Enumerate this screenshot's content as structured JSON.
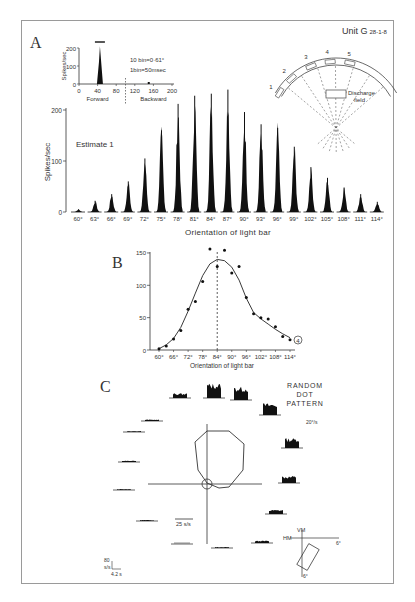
{
  "figure": {
    "unit_label": "Unit G",
    "unit_sub": "28-1-8",
    "panel_labels": [
      "A",
      "B",
      "C"
    ]
  },
  "chart_data": [
    {
      "id": "A-inset",
      "type": "bar",
      "title": "",
      "ylabel": "Spikes/sec",
      "ylim": [
        0,
        200
      ],
      "yticks": [
        0,
        100,
        200
      ],
      "xticks": [
        0,
        40,
        80,
        120,
        160,
        200
      ],
      "xlabels": {
        "left": "Forward",
        "right": "Backward"
      },
      "divider_x": 100,
      "annotations": [
        "10 bin=0·61°",
        "1bin=50msec"
      ],
      "peaks": [
        {
          "x": 45,
          "y": 210
        },
        {
          "x": 150,
          "y": 5
        }
      ]
    },
    {
      "id": "A-main",
      "type": "bar",
      "title": "",
      "annotation": "Estimate 1",
      "xlabel": "Orientation of light bar",
      "ylabel": "Spikes/sec",
      "ylim": [
        0,
        250
      ],
      "yticks": [
        0,
        100,
        200
      ],
      "categories": [
        "60°",
        "63°",
        "66°",
        "69°",
        "72°",
        "75°",
        "78°",
        "81°",
        "84°",
        "87°",
        "90°",
        "93°",
        "96°",
        "99°",
        "102°",
        "105°",
        "108°",
        "111°",
        "114°"
      ],
      "values": [
        5,
        22,
        35,
        60,
        105,
        160,
        212,
        228,
        232,
        240,
        196,
        172,
        165,
        128,
        88,
        67,
        48,
        35,
        20
      ]
    },
    {
      "id": "B",
      "type": "scatter",
      "title": "",
      "xlabel": "Orientation of light bar",
      "ylabel": "",
      "ylim": [
        0,
        150
      ],
      "yticks": [
        0,
        50,
        100,
        150
      ],
      "xticks": [
        "60°",
        "66°",
        "72°",
        "78°",
        "84°",
        "90°",
        "96°",
        "102°",
        "108°",
        "114°"
      ],
      "x": [
        60,
        63,
        66,
        69,
        72,
        75,
        78,
        81,
        84,
        87,
        90,
        93,
        96,
        99,
        102,
        105,
        108,
        111,
        114
      ],
      "values": [
        2,
        6,
        17,
        30,
        63,
        75,
        106,
        156,
        129,
        154,
        119,
        129,
        81,
        56,
        50,
        48,
        36,
        21,
        16
      ],
      "fit_curve": [
        [
          60,
          2
        ],
        [
          63,
          8
        ],
        [
          66,
          18
        ],
        [
          69,
          35
        ],
        [
          72,
          60
        ],
        [
          75,
          88
        ],
        [
          78,
          115
        ],
        [
          81,
          133
        ],
        [
          84,
          140
        ],
        [
          87,
          138
        ],
        [
          90,
          128
        ],
        [
          93,
          108
        ],
        [
          96,
          80
        ],
        [
          99,
          58
        ],
        [
          102,
          48
        ],
        [
          105,
          40
        ],
        [
          108,
          32
        ],
        [
          111,
          25
        ],
        [
          114,
          19
        ]
      ],
      "peak_marker_x": 84,
      "end_marker": "4"
    },
    {
      "id": "C",
      "type": "polar",
      "title": "RANDOM DOT PATTERN",
      "speed": "20°/s",
      "polar_scale": "25 s/s",
      "hist_scale_y": "80 s/s",
      "hist_scale_x": "4.2 s",
      "inset_labels": {
        "vertical": "VM",
        "horizontal": "HM",
        "right": "6°",
        "bottom": "6°"
      },
      "directions_deg": [
        90,
        67.5,
        45,
        22.5,
        0,
        -22.5,
        -45,
        -67.5,
        -90,
        -112.5,
        -135,
        -157.5,
        180,
        157.5,
        135,
        112.5
      ],
      "responses": [
        62,
        56,
        50,
        42,
        30,
        18,
        10,
        4,
        2,
        4,
        4,
        6,
        4,
        6,
        20,
        48
      ]
    }
  ],
  "caption": {
    "text": ""
  }
}
